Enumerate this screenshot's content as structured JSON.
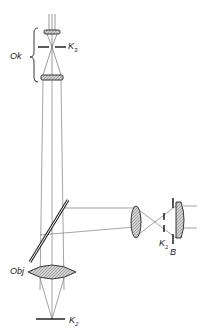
{
  "diagram": {
    "type": "optical-ray-diagram",
    "labels": {
      "ok": "Ok",
      "k3": "K",
      "k3_sub": "3",
      "k1": "K",
      "k1_sub": "1",
      "b": "B",
      "obj": "Obj",
      "k2": "K",
      "k2_sub": "2"
    },
    "components": [
      {
        "id": "eyepiece-eye-lens",
        "group": "Ok"
      },
      {
        "id": "aperture-k3",
        "label": "K3"
      },
      {
        "id": "eyepiece-field-lens",
        "group": "Ok"
      },
      {
        "id": "beam-splitter-mirror"
      },
      {
        "id": "side-lens"
      },
      {
        "id": "aperture-k1",
        "label": "K1"
      },
      {
        "id": "stop-b",
        "label": "B"
      },
      {
        "id": "objective-lens",
        "label": "Obj"
      },
      {
        "id": "plane-k2",
        "label": "K2"
      }
    ],
    "colors": {
      "line": "#333333",
      "lens_fill": "#c8c8c8",
      "background": "#ffffff"
    }
  }
}
